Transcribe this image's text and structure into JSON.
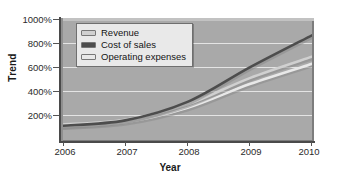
{
  "chart_data": {
    "type": "line",
    "title": "",
    "xlabel": "Year",
    "ylabel": "Trend",
    "x": [
      2006,
      2007,
      2008,
      2009,
      2010
    ],
    "xticklabels": [
      "2006",
      "2007",
      "2008",
      "2009",
      "2010"
    ],
    "yticklabels": [
      "200%",
      "400%",
      "600%",
      "800%",
      "1000%"
    ],
    "yticks": [
      200,
      400,
      600,
      800,
      1000
    ],
    "ylim": [
      0,
      1000
    ],
    "xlim": [
      2006,
      2010
    ],
    "grid": true,
    "legend_position": "top-left",
    "series": [
      {
        "name": "Revenue",
        "color": "#d0d0d0",
        "values": [
          130,
          170,
          300,
          520,
          700
        ]
      },
      {
        "name": "Cost of sales",
        "color": "#4d4d4d",
        "values": [
          120,
          165,
          320,
          610,
          880
        ]
      },
      {
        "name": "Operating expenses",
        "color": "#e8e8e8",
        "values": [
          115,
          150,
          270,
          470,
          640
        ]
      }
    ]
  },
  "legend": {
    "items": [
      {
        "label": "Revenue"
      },
      {
        "label": "Cost of sales"
      },
      {
        "label": "Operating expenses"
      }
    ]
  },
  "axes": {
    "y_title": "Trend",
    "x_title": "Year",
    "y_ticks": [
      "1000%",
      "800%",
      "600%",
      "400%",
      "200%"
    ],
    "x_ticks": [
      "2006",
      "2007",
      "2008",
      "2009",
      "2010"
    ]
  },
  "colors": {
    "plot_background": "#a9a9a9",
    "gridline": "#efefef",
    "axis": "#4a4a4a",
    "legend_background": "#e9e9e9",
    "revenue": "#d0d0d0",
    "cost_of_sales": "#4d4d4d",
    "operating_expenses": "#e8e8e8"
  }
}
